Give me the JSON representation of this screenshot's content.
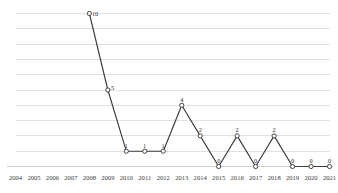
{
  "chart_data": {
    "type": "line",
    "title": "",
    "subtitle": "",
    "xlabel": "",
    "ylabel": "",
    "categories": [
      "2004",
      "2005",
      "2006",
      "2007",
      "2008",
      "2009",
      "2010",
      "2011",
      "2012",
      "2013",
      "2014",
      "2015",
      "2016",
      "2017",
      "2018",
      "2019",
      "2020",
      "2021"
    ],
    "values": [
      null,
      null,
      null,
      null,
      10,
      5,
      1,
      1,
      1,
      4,
      2,
      0,
      2,
      0,
      2,
      0,
      0,
      0
    ],
    "point_labels": [
      "",
      "",
      "",
      "",
      "10",
      "5",
      "1",
      "1",
      "1",
      "4",
      "2",
      "0",
      "2",
      "0",
      "2",
      "0",
      "0",
      "0"
    ],
    "series": [
      {
        "name": "",
        "values": [
          null,
          null,
          null,
          null,
          10,
          5,
          1,
          1,
          1,
          4,
          2,
          0,
          2,
          0,
          2,
          0,
          0,
          0
        ]
      }
    ],
    "ylim": [
      0,
      10
    ],
    "xlim": [
      "2004",
      "2021"
    ],
    "y_gridline_values": [
      0,
      1,
      2,
      3,
      4,
      5,
      6,
      7,
      8,
      9,
      10
    ],
    "grid": true,
    "y_axis_labels_visible": false,
    "legend": false,
    "legend_position": "none",
    "marker": "open-circle",
    "colors": {
      "line": "#3b3b3b",
      "marker_fill": "#ffffff",
      "marker_stroke": "#3b3b3b",
      "gridline": "#d8d8d8",
      "axis": "#c9c9c9",
      "label_text": "#2b2b2b",
      "tick_text": "#3a3a3a",
      "background": "#ffffff"
    }
  }
}
